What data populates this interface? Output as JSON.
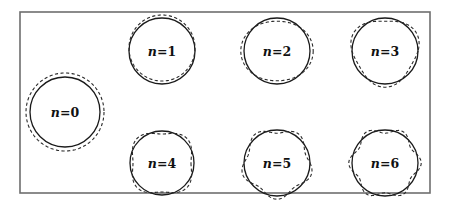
{
  "figure": {
    "frame": {
      "x": 20,
      "y": 12,
      "width": 410,
      "height": 181,
      "stroke": "#6e6e6e"
    },
    "radius": 33,
    "amplitude": 3.2,
    "modes": [
      {
        "n": 0,
        "label_var": "n",
        "label_eq": "=",
        "label_val": "0",
        "cx": 65,
        "cy": 112,
        "r": 35,
        "phase": 0,
        "amp": 4.0
      },
      {
        "n": 1,
        "label_var": "n",
        "label_eq": "=",
        "label_val": "1",
        "cx": 162,
        "cy": 51,
        "r": 33,
        "phase": 90,
        "amp": 3.0
      },
      {
        "n": 2,
        "label_var": "n",
        "label_eq": "=",
        "label_val": "2",
        "cx": 277,
        "cy": 51,
        "r": 33,
        "phase": 0,
        "amp": 3.2
      },
      {
        "n": 3,
        "label_var": "n",
        "label_eq": "=",
        "label_val": "3",
        "cx": 385,
        "cy": 51,
        "r": 33,
        "phase": 90,
        "amp": 3.2
      },
      {
        "n": 4,
        "label_var": "n",
        "label_eq": "=",
        "label_val": "4",
        "cx": 162,
        "cy": 163,
        "r": 32,
        "phase": 45,
        "amp": 3.0
      },
      {
        "n": 5,
        "label_var": "n",
        "label_eq": "=",
        "label_val": "5",
        "cx": 277,
        "cy": 163,
        "r": 33,
        "phase": 90,
        "amp": 3.2
      },
      {
        "n": 6,
        "label_var": "n",
        "label_eq": "=",
        "label_val": "6",
        "cx": 385,
        "cy": 163,
        "r": 33,
        "phase": 0,
        "amp": 3.2
      }
    ]
  }
}
